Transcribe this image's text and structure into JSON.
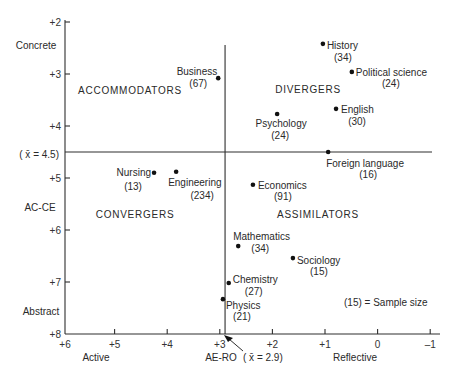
{
  "chart_data": {
    "type": "scatter",
    "title": "",
    "xlabel": "AE-RO",
    "ylabel": "AC-CE",
    "x_end_labels": {
      "left": "Active",
      "right": "Reflective"
    },
    "y_end_labels": {
      "top": "Concrete",
      "bottom": "Abstract"
    },
    "xlim": [
      6,
      -1
    ],
    "ylim": [
      2,
      8
    ],
    "x_reversed": true,
    "y_inverted": true,
    "grid": false,
    "xticks": [
      {
        "value": 6,
        "label": "+6"
      },
      {
        "value": 5,
        "label": "+5"
      },
      {
        "value": 4,
        "label": "+4"
      },
      {
        "value": 3,
        "label": "+3"
      },
      {
        "value": 2,
        "label": "+2"
      },
      {
        "value": 1,
        "label": "+1"
      },
      {
        "value": 0,
        "label": "0"
      },
      {
        "value": -1,
        "label": "–1"
      }
    ],
    "yticks": [
      {
        "value": 2,
        "label": "+2"
      },
      {
        "value": 3,
        "label": "+3"
      },
      {
        "value": 4,
        "label": "+4"
      },
      {
        "value": 5,
        "label": "+5"
      },
      {
        "value": 6,
        "label": "+6"
      },
      {
        "value": 7,
        "label": "+7"
      },
      {
        "value": 8,
        "label": "+8"
      }
    ],
    "mean_lines": {
      "x": {
        "value": 2.9,
        "label": "( x̄ = 2.9)"
      },
      "y": {
        "value": 4.5,
        "label": "( x̄ = 4.5)"
      }
    },
    "quadrants": {
      "top_left": "ACCOMMODATORS",
      "top_right": "DIVERGERS",
      "bottom_left": "CONVERGERS",
      "bottom_right": "ASSIMILATORS"
    },
    "note": "(15) = Sample size",
    "points": [
      {
        "name": "History",
        "n": 34,
        "n_label": "(34)",
        "x": 1.04,
        "y": 2.42
      },
      {
        "name": "Political science",
        "n": 24,
        "n_label": "(24)",
        "x": 0.49,
        "y": 2.96
      },
      {
        "name": "Business",
        "n": 67,
        "n_label": "(67)",
        "x": 3.03,
        "y": 3.08
      },
      {
        "name": "English",
        "n": 30,
        "n_label": "(30)",
        "x": 0.79,
        "y": 3.67
      },
      {
        "name": "Psychology",
        "n": 24,
        "n_label": "(24)",
        "x": 1.91,
        "y": 3.77
      },
      {
        "name": "Foreign language",
        "n": 16,
        "n_label": "(16)",
        "x": 0.94,
        "y": 4.5
      },
      {
        "name": "Nursing",
        "n": 13,
        "n_label": "(13)",
        "x": 4.25,
        "y": 4.9
      },
      {
        "name": "Engineering",
        "n": 234,
        "n_label": "(234)",
        "x": 3.83,
        "y": 4.88
      },
      {
        "name": "Economics",
        "n": 91,
        "n_label": "(91)",
        "x": 2.37,
        "y": 5.13
      },
      {
        "name": "Mathematics",
        "n": 34,
        "n_label": "(34)",
        "x": 2.65,
        "y": 6.31
      },
      {
        "name": "Sociology",
        "n": 15,
        "n_label": "(15)",
        "x": 1.61,
        "y": 6.54
      },
      {
        "name": "Chemistry",
        "n": 27,
        "n_label": "(27)",
        "x": 2.83,
        "y": 7.02
      },
      {
        "name": "Physics",
        "n": 21,
        "n_label": "(21)",
        "x": 2.94,
        "y": 7.33
      }
    ]
  }
}
